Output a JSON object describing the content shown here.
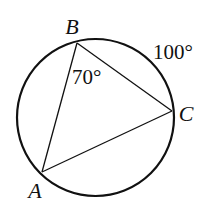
{
  "figure": {
    "type": "inscribed-triangle-in-circle",
    "circle": {
      "cx": 95.5,
      "cy": 117.5,
      "r": 78.5
    },
    "points": {
      "A": {
        "label": "A",
        "x": 42,
        "y": 172,
        "label_x": 35,
        "label_y": 198
      },
      "B": {
        "label": "B",
        "x": 77,
        "y": 43,
        "label_x": 72,
        "label_y": 34
      },
      "C": {
        "label": "C",
        "x": 172,
        "y": 111,
        "label_x": 186,
        "label_y": 121
      }
    },
    "annotations": {
      "angle_B": {
        "text": "70°",
        "x": 72,
        "y": 84
      },
      "arc_BC": {
        "text": "100°",
        "x": 153,
        "y": 59
      }
    },
    "colors": {
      "stroke": "#111111",
      "background": "#ffffff"
    }
  }
}
